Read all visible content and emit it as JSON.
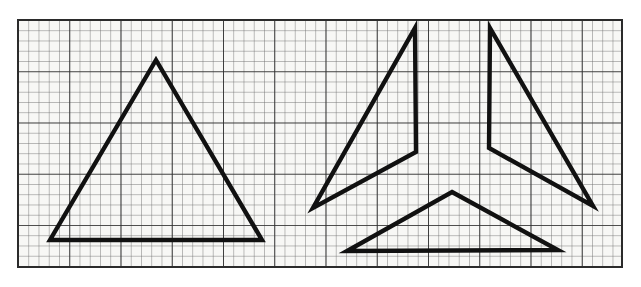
{
  "figure": {
    "media": "graph-paper-line-drawing",
    "background_color": "#ffffff",
    "paper_tint_color": "#f7f7f5",
    "canvas": {
      "width": 641,
      "height": 287
    }
  },
  "grid": {
    "label": "graph paper grid",
    "x": 18,
    "y": 20,
    "width": 604,
    "height": 247,
    "cell_size": 10.25,
    "minor_line_color": "#6d6d6d",
    "minor_line_width": 0.9,
    "major_line_color": "#2b2b2b",
    "major_line_width": 1.7,
    "major_every": 5,
    "border_color": "#2b2b2b",
    "border_width": 2.0,
    "columns": 59,
    "rows": 24
  },
  "ink": {
    "stroke_color": "#111111",
    "stroke_width": 4.4,
    "join": "miter",
    "cap": "butt"
  },
  "shapes": {
    "left_figure": {
      "name": "whole-triangle",
      "description": "Large isosceles triangle drawn as one closed outline",
      "points": [
        [
          156,
          60
        ],
        [
          262,
          240
        ],
        [
          50,
          240
        ]
      ]
    },
    "right_figure": {
      "name": "dissected-triangle",
      "description": "Same triangle cut into three arm pieces arranged as a pinwheel with gaps",
      "pieces": [
        {
          "name": "left-arm-piece",
          "points": [
            [
              415,
              28
            ],
            [
              416,
              152
            ],
            [
              313,
              208
            ]
          ]
        },
        {
          "name": "right-arm-piece",
          "points": [
            [
              490,
              28
            ],
            [
              593,
              206
            ],
            [
              489,
              148
            ]
          ]
        },
        {
          "name": "bottom-arm-piece",
          "points": [
            [
              452,
              192
            ],
            [
              558,
              250
            ],
            [
              347,
              251
            ]
          ]
        }
      ]
    }
  }
}
